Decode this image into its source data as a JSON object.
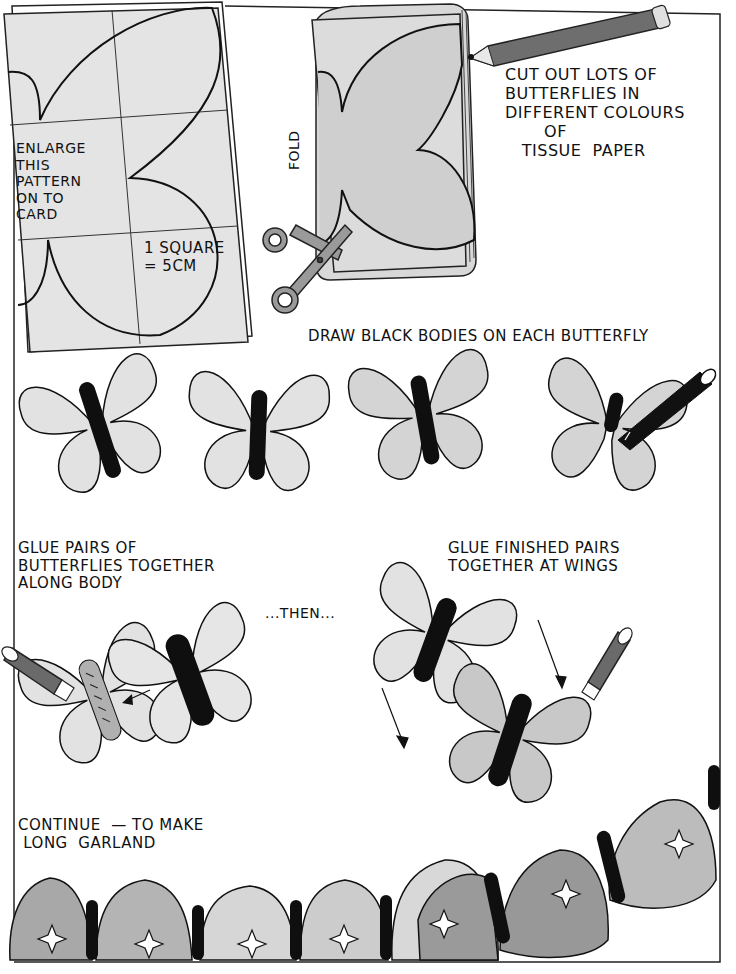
{
  "illustration": {
    "title": "Butterfly garland instructions",
    "colors": {
      "ink": "#111111",
      "paper_light": "#e2e2e2",
      "paper_mid": "#c4c4c4",
      "paper_dark": "#a2a2a2",
      "pencil_body": "#6e6e6e",
      "scissors": "#9a9a9a",
      "background": "#ffffff"
    },
    "steps": {
      "pattern": {
        "label": "ENLARGE\nTHIS\nPATTERN\nON TO\nCARD",
        "scale_note": "1 SQUARE\n= 5CM"
      },
      "cut": {
        "fold_label": "FOLD",
        "label": "CUT OUT LOTS OF\nBUTTERFLIES IN\nDIFFERENT COLOURS\n       OF\n   TISSUE  PAPER"
      },
      "draw": {
        "label": "DRAW BLACK BODIES ON EACH BUTTERFLY"
      },
      "glue_pairs": {
        "label": "GLUE PAIRS OF\nBUTTERFLIES TOGETHER\nALONG BODY",
        "then": "...THEN..."
      },
      "glue_wings": {
        "label": "GLUE FINISHED PAIRS\nTOGETHER AT WINGS"
      },
      "continue": {
        "label": "CONTINUE  — TO MAKE\n LONG  GARLAND"
      }
    },
    "icons": [
      "pattern-card",
      "tissue-paper-stack",
      "pencil-icon",
      "scissors-icon",
      "marker-pen-icon",
      "glue-stick-icon",
      "arrow-icon",
      "butterfly-icon",
      "garland"
    ]
  }
}
